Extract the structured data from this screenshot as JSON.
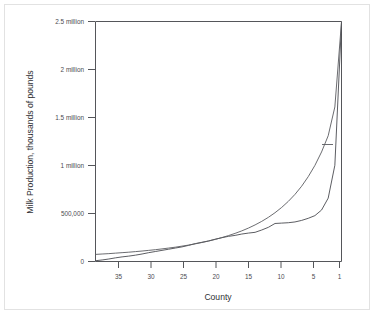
{
  "figure": {
    "caption_partial": "",
    "background_color": "#ffffff",
    "frame_color": "#e2e2e2",
    "ink_color": "#4a4b50"
  },
  "chart_data": {
    "type": "line",
    "title": "",
    "subtitle": "",
    "xlabel": "County",
    "ylabel": "Milk Production, thousands of pounds",
    "grid": false,
    "legend_position": "none",
    "x_axis_reversed": true,
    "xlim": [
      38,
      1
    ],
    "ylim": [
      0,
      2500000
    ],
    "x_tick_values": [
      35,
      30,
      25,
      20,
      15,
      10,
      5,
      1
    ],
    "x_tick_labels": [
      "35",
      "30",
      "25",
      "20",
      "15",
      "10",
      "5",
      "1"
    ],
    "y_tick_values": [
      0,
      500000,
      1000000,
      1500000,
      2000000,
      2500000
    ],
    "y_tick_labels": [
      "0",
      "500,000",
      "1 million",
      "1.5 million",
      "2 million",
      "2.5 million"
    ],
    "annotations": [
      {
        "text": "",
        "kind": "tick-mark-on-curve",
        "x": 2.1,
        "y": 1225000
      }
    ],
    "series": [
      {
        "name": "Ranked county milk production",
        "kind": "empirical",
        "x": [
          38,
          37,
          36,
          35,
          34,
          33,
          32,
          31,
          30,
          29,
          28,
          27,
          26,
          25,
          24,
          23,
          22,
          21,
          20,
          19,
          18,
          17,
          16,
          15,
          14,
          13,
          12,
          11,
          10,
          9,
          8,
          7,
          6,
          5,
          4,
          3,
          2,
          1
        ],
        "values": [
          8000,
          16000,
          26000,
          38000,
          48000,
          56000,
          66000,
          78000,
          92000,
          104000,
          116000,
          128000,
          140000,
          152000,
          168000,
          186000,
          200000,
          214000,
          232000,
          248000,
          262000,
          272000,
          286000,
          296000,
          304000,
          328000,
          356000,
          396000,
          400000,
          404000,
          412000,
          428000,
          450000,
          478000,
          536000,
          660000,
          1002000,
          2490000
        ]
      },
      {
        "name": "Fitted smooth curve",
        "kind": "fitted",
        "x": [
          38,
          37,
          36,
          35,
          34,
          33,
          32,
          31,
          30,
          29,
          28,
          27,
          26,
          25,
          24,
          23,
          22,
          21,
          20,
          19,
          18,
          17,
          16,
          15,
          14,
          13,
          12,
          11,
          10,
          9,
          8,
          7,
          6,
          5,
          4,
          3,
          2,
          1
        ],
        "values": [
          74000,
          78000,
          82000,
          87000,
          92000,
          97000,
          103000,
          109000,
          116000,
          123000,
          131000,
          140000,
          149000,
          160000,
          171000,
          184000,
          198000,
          213000,
          230000,
          249000,
          270000,
          293000,
          319000,
          348000,
          381000,
          418000,
          460000,
          508000,
          563000,
          626000,
          699000,
          784000,
          884000,
          1001000,
          1141000,
          1310000,
          1610000,
          2495000
        ]
      }
    ]
  }
}
